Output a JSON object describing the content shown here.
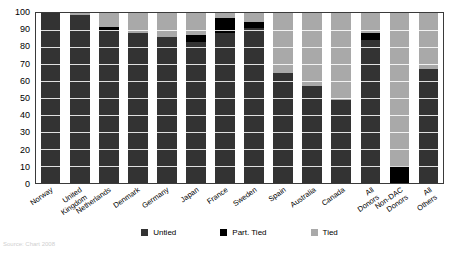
{
  "chart_data": {
    "type": "bar",
    "stacked": true,
    "title": "",
    "subtitle": "",
    "xlabel": "",
    "ylabel": "",
    "ylim": [
      0,
      100
    ],
    "yticks": [
      0,
      10,
      20,
      30,
      40,
      50,
      60,
      70,
      80,
      90,
      100
    ],
    "grid": true,
    "legend_position": "bottom",
    "categories": [
      "Norway",
      "United Kingdom",
      "Netherlands",
      "Denmark",
      "Germany",
      "Japan",
      "France",
      "Sweden",
      "Spain",
      "Australia",
      "Canada",
      "All Donors",
      "Non-DAC Donors",
      "All Others"
    ],
    "series": [
      {
        "name": "Untied",
        "color": "#333333",
        "values": [
          100,
          99,
          90,
          88,
          86,
          83,
          88,
          91,
          65,
          57,
          49,
          84,
          0,
          67
        ]
      },
      {
        "name": "Part. Tied",
        "color": "#000000",
        "values": [
          0,
          0,
          2,
          0,
          0,
          4,
          9,
          4,
          0,
          0,
          0,
          4,
          10,
          0
        ]
      },
      {
        "name": "Tied",
        "color": "#a9a9a9",
        "values": [
          0,
          1,
          8,
          12,
          14,
          13,
          3,
          5,
          35,
          43,
          51,
          12,
          90,
          33
        ]
      }
    ]
  },
  "legend": {
    "items": [
      {
        "label": "Untied",
        "color": "#333333"
      },
      {
        "label": "Part. Tied",
        "color": "#000000"
      },
      {
        "label": "Tied",
        "color": "#a9a9a9"
      }
    ]
  },
  "footer": {
    "note": "Source: Chart 2008"
  }
}
